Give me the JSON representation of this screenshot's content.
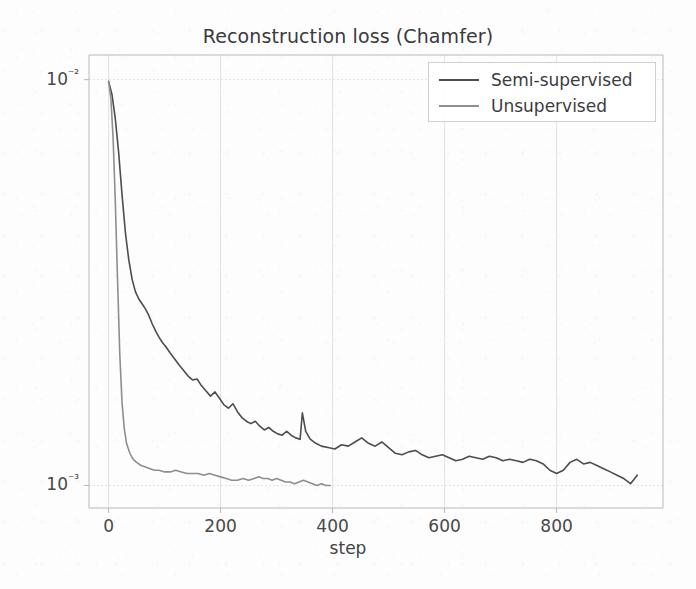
{
  "chart_data": {
    "type": "line",
    "title": "Reconstruction loss (Chamfer)",
    "xlabel": "step",
    "ylabel": "",
    "yscale": "log",
    "xlim": [
      -35,
      990
    ],
    "ylim": [
      0.00088,
      0.0115
    ],
    "grid": true,
    "grid_color": "#e2e2e6",
    "legend_position": "upper right",
    "xticks": [
      0,
      200,
      400,
      600,
      800
    ],
    "xtick_labels": [
      "0",
      "200",
      "400",
      "600",
      "800"
    ],
    "yticks": [
      0.01,
      0.001
    ],
    "ytick_labels": [
      "10⁻²",
      "10⁻³"
    ],
    "series": [
      {
        "name": "Semi-supervised",
        "color": "#4d4d50",
        "linewidth": 1.6,
        "x": [
          0,
          6,
          12,
          18,
          24,
          30,
          36,
          42,
          48,
          54,
          60,
          66,
          72,
          78,
          84,
          90,
          96,
          102,
          110,
          118,
          126,
          134,
          142,
          150,
          158,
          166,
          174,
          182,
          190,
          198,
          206,
          214,
          222,
          230,
          238,
          246,
          254,
          262,
          270,
          278,
          286,
          294,
          302,
          310,
          318,
          326,
          334,
          342,
          346,
          352,
          360,
          370,
          380,
          392,
          404,
          416,
          428,
          440,
          452,
          464,
          476,
          488,
          500,
          512,
          524,
          536,
          548,
          560,
          572,
          584,
          596,
          608,
          620,
          632,
          644,
          656,
          668,
          680,
          692,
          704,
          716,
          728,
          740,
          752,
          764,
          776,
          788,
          800,
          812,
          824,
          836,
          848,
          860,
          872,
          884,
          896,
          908,
          920,
          932,
          944
        ],
        "y": [
          0.0099,
          0.0092,
          0.008,
          0.0066,
          0.0052,
          0.0042,
          0.0036,
          0.00322,
          0.003,
          0.00288,
          0.0028,
          0.00272,
          0.00262,
          0.0025,
          0.0024,
          0.00232,
          0.00225,
          0.0022,
          0.00212,
          0.00205,
          0.00198,
          0.00192,
          0.00186,
          0.00182,
          0.00183,
          0.00176,
          0.00171,
          0.00166,
          0.0017,
          0.00164,
          0.00158,
          0.00155,
          0.00159,
          0.00152,
          0.00147,
          0.00144,
          0.00142,
          0.00144,
          0.0014,
          0.00137,
          0.00139,
          0.00136,
          0.00134,
          0.00133,
          0.00136,
          0.00133,
          0.00131,
          0.0013,
          0.00151,
          0.00136,
          0.0013,
          0.00127,
          0.00125,
          0.00124,
          0.00123,
          0.00126,
          0.00125,
          0.00128,
          0.00131,
          0.00127,
          0.00125,
          0.00128,
          0.00124,
          0.0012,
          0.00119,
          0.00121,
          0.00122,
          0.00119,
          0.00117,
          0.00118,
          0.00119,
          0.00117,
          0.00115,
          0.00116,
          0.00118,
          0.00117,
          0.00116,
          0.00118,
          0.00117,
          0.00115,
          0.00116,
          0.00115,
          0.00114,
          0.00116,
          0.00115,
          0.00113,
          0.00109,
          0.00107,
          0.00109,
          0.00114,
          0.00116,
          0.00113,
          0.00114,
          0.00112,
          0.0011,
          0.00108,
          0.00106,
          0.00104,
          0.00101,
          0.00106
        ]
      },
      {
        "name": "Unsupervised",
        "color": "#8e8e92",
        "linewidth": 1.6,
        "x": [
          0,
          4,
          8,
          12,
          16,
          20,
          24,
          28,
          32,
          38,
          44,
          50,
          58,
          66,
          74,
          82,
          90,
          100,
          110,
          120,
          130,
          140,
          150,
          160,
          170,
          180,
          190,
          200,
          210,
          220,
          230,
          240,
          250,
          260,
          268,
          276,
          284,
          292,
          300,
          308,
          316,
          324,
          332,
          340,
          348,
          356,
          364,
          372,
          380,
          388,
          396
        ],
        "y": [
          0.0099,
          0.009,
          0.0072,
          0.005,
          0.0032,
          0.0021,
          0.0016,
          0.00138,
          0.00127,
          0.0012,
          0.00116,
          0.00114,
          0.00112,
          0.00111,
          0.0011,
          0.00109,
          0.00109,
          0.00108,
          0.00108,
          0.00109,
          0.00108,
          0.00107,
          0.00107,
          0.00107,
          0.00106,
          0.00107,
          0.00106,
          0.00105,
          0.00104,
          0.00103,
          0.00103,
          0.00104,
          0.00103,
          0.00104,
          0.00105,
          0.00104,
          0.00104,
          0.00103,
          0.00104,
          0.00103,
          0.00102,
          0.00102,
          0.00101,
          0.00102,
          0.00103,
          0.00102,
          0.00101,
          0.001,
          0.00101,
          0.001,
          0.001
        ]
      }
    ]
  },
  "legend": {
    "items": [
      {
        "label": "Semi-supervised"
      },
      {
        "label": "Unsupervised"
      }
    ]
  },
  "axes": {
    "spine_color": "#b9b9bd"
  }
}
